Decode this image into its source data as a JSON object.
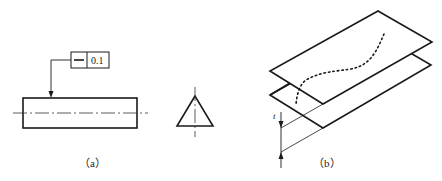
{
  "figure_a": {
    "caption": "（a）",
    "tolerance_frame": {
      "symbol": "straightness",
      "symbol_glyph": "—",
      "value": "0.1"
    }
  },
  "figure_b": {
    "caption": "（b）",
    "dimension_label": "t"
  },
  "colors": {
    "line": "#1a1a1a",
    "background": "#ffffff"
  }
}
